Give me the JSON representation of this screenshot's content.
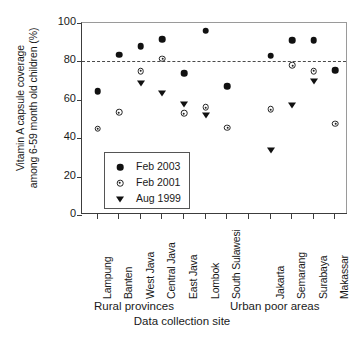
{
  "chart_data": {
    "type": "scatter",
    "title": "",
    "xlabel": "Data collection site",
    "ylabel_line1": "Vitamin A capsule coverage",
    "ylabel_line2": "among 6-59 month old children (%)",
    "ylim": [
      0,
      100
    ],
    "yticks": [
      0,
      20,
      40,
      60,
      80,
      100
    ],
    "ytick_labels": [
      "0",
      "20",
      "40",
      "60",
      "80",
      "100"
    ],
    "grid": false,
    "reference_line": {
      "value": 80,
      "style": "dashed",
      "label": ""
    },
    "legend_position": "inside-lower-left",
    "categories": [
      "Lampung",
      "Banten",
      "West Java",
      "Central Java",
      "East Java",
      "Lombok",
      "South Sulawesi",
      "",
      "Jakarta",
      "Semarang",
      "Surabaya",
      "Makassar"
    ],
    "groups": [
      {
        "name": "Rural provinces",
        "categories": [
          "Lampung",
          "Banten",
          "West Java",
          "Central Java",
          "East Java",
          "Lombok",
          "South Sulawesi"
        ]
      },
      {
        "name": "Urban poor areas",
        "categories": [
          "Jakarta",
          "Semarang",
          "Surabaya",
          "Makassar"
        ]
      }
    ],
    "series": [
      {
        "name": "Feb 2003",
        "marker": "filled-circle",
        "values": [
          64.5,
          83.5,
          88.0,
          91.5,
          74.0,
          96.0,
          67.0,
          null,
          83.0,
          91.0,
          91.0,
          75.5
        ]
      },
      {
        "name": "Feb 2001",
        "marker": "open-circle-dot",
        "values": [
          45.0,
          53.5,
          75.0,
          81.5,
          53.0,
          56.0,
          45.5,
          null,
          55.0,
          78.0,
          75.0,
          47.5
        ]
      },
      {
        "name": "Aug 1999",
        "marker": "filled-triangle-down",
        "values": [
          null,
          null,
          68.5,
          63.5,
          58.0,
          52.0,
          null,
          null,
          34.0,
          57.5,
          70.0,
          null
        ]
      }
    ]
  },
  "legend": {
    "items": [
      {
        "label": "Feb 2003",
        "marker": "filled-circle"
      },
      {
        "label": "Feb 2001",
        "marker": "open-circle-dot"
      },
      {
        "label": "Aug 1999",
        "marker": "filled-triangle-down"
      }
    ]
  },
  "colors": {
    "marker": "#111111",
    "axis": "#3c3c3c",
    "reference_line": "#4a4a4a",
    "background": "#ffffff"
  }
}
